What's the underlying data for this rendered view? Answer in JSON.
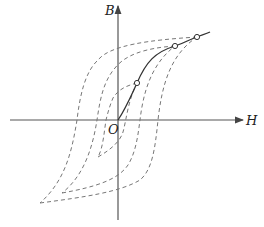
{
  "diagram": {
    "axes": {
      "y_label": "B",
      "x_label": "H",
      "origin_label": "O"
    },
    "curves": {
      "initial_magnetization": {
        "style": "solid",
        "points": 3
      },
      "hysteresis_loops": [
        {
          "name": "small-loop",
          "style": "dashed"
        },
        {
          "name": "medium-loop",
          "style": "dashed"
        },
        {
          "name": "large-loop",
          "style": "dashed"
        }
      ]
    },
    "colors": {
      "axis": "#555555",
      "solid_curve": "#333333",
      "dashed_curve": "#777777"
    }
  }
}
